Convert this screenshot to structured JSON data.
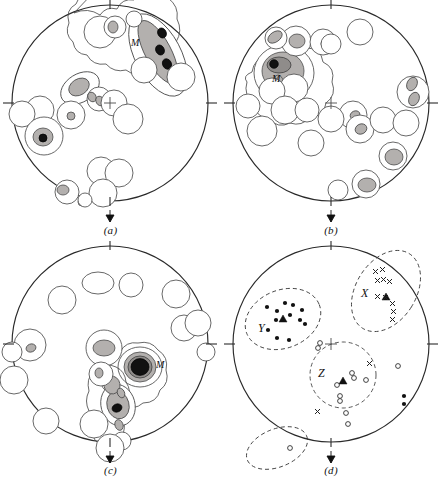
{
  "figure": {
    "kind": "stereographic-projection-fabric-diagrams",
    "panel_count": 4,
    "colors": {
      "outline": "#2a2a2a",
      "contour_line": "#4d4d4d",
      "fill_light": "#b3b0ae",
      "fill_mid": "#8f8c8a",
      "fill_max": "#111111",
      "background": "#ffffff",
      "dashed_field": "#3a3a3a"
    },
    "common": {
      "net_radius": 98,
      "tick_positions_deg": [
        0,
        90,
        180,
        270
      ],
      "center_cross_label": "center-cross",
      "arrow_label": "down-arrow-marker"
    }
  },
  "panels": [
    {
      "id": "a",
      "label": "(a)",
      "center": [
        110,
        103
      ],
      "radius": 98,
      "max_label": "M",
      "max_label_pos": [
        131,
        43
      ],
      "description": "girdle of contours with three black maxima in upper right labelled M",
      "contours": [
        {
          "level": 1,
          "class": "c1",
          "cx": 158,
          "cy": 55,
          "rx": 22,
          "ry": 44,
          "rot": -28
        },
        {
          "level": 2,
          "class": "c2",
          "cx": 158,
          "cy": 52,
          "rx": 13,
          "ry": 34,
          "rot": -28
        },
        {
          "level": 4,
          "class": "c4",
          "cx": 161,
          "cy": 33,
          "rx": 4.2,
          "ry": 5.2,
          "rot": -28
        },
        {
          "level": 4,
          "class": "c4",
          "cx": 159,
          "cy": 50,
          "rx": 4.2,
          "ry": 5.2,
          "rot": -28
        },
        {
          "level": 4,
          "class": "c4",
          "cx": 166,
          "cy": 63,
          "rx": 4.4,
          "ry": 5.4,
          "rot": -28
        },
        {
          "level": 1,
          "class": "c1",
          "cx": 80,
          "cy": 88,
          "rx": 20,
          "ry": 13,
          "rot": -32
        },
        {
          "level": 2,
          "class": "c2",
          "cx": 79,
          "cy": 87,
          "rx": 11,
          "ry": 8,
          "rot": -32
        },
        {
          "level": 1,
          "class": "c1",
          "cx": 44,
          "cy": 135,
          "rx": 19,
          "ry": 16,
          "rot": 0
        },
        {
          "level": 2,
          "class": "c2",
          "cx": 43,
          "cy": 136,
          "rx": 10,
          "ry": 9,
          "rot": 0
        },
        {
          "level": 4,
          "class": "c4",
          "cx": 43,
          "cy": 137,
          "rx": 4,
          "ry": 4,
          "rot": 0
        }
      ],
      "open_contours": [
        [
          100,
          32,
          18,
          13
        ],
        [
          64,
          118,
          16,
          16
        ],
        [
          40,
          110,
          14,
          14
        ],
        [
          128,
          120,
          14,
          14
        ],
        [
          84,
          117,
          13,
          13
        ],
        [
          101,
          171,
          14,
          12
        ],
        [
          118,
          173,
          14,
          12
        ],
        [
          103,
          193,
          14,
          13
        ],
        [
          67,
          192,
          12,
          10
        ],
        [
          144,
          68,
          13,
          13
        ],
        [
          181,
          77,
          14,
          14
        ],
        [
          109,
          99,
          13,
          12
        ]
      ]
    },
    {
      "id": "b",
      "label": "(b)",
      "center": [
        331,
        103
      ],
      "radius": 98,
      "max_label": "M",
      "max_label_pos": [
        275,
        78
      ],
      "description": "single strong maximum upper left with scattered contours to right and bottom",
      "contours": [
        {
          "level": 1,
          "class": "c1",
          "cx": 284,
          "cy": 73,
          "rx": 30,
          "ry": 27,
          "rot": 0
        },
        {
          "level": 2,
          "class": "c2",
          "cx": 283,
          "cy": 72,
          "rx": 21,
          "ry": 19,
          "rot": 0
        },
        {
          "level": 3,
          "class": "c3",
          "cx": 279,
          "cy": 66,
          "rx": 11,
          "ry": 8,
          "rot": 0
        },
        {
          "level": 4,
          "class": "c4",
          "cx": 274,
          "cy": 64,
          "rx": 4.2,
          "ry": 4.2,
          "rot": 0
        },
        {
          "level": 2,
          "class": "c2",
          "cx": 292,
          "cy": 86,
          "rx": 10,
          "ry": 11,
          "rot": 0
        },
        {
          "level": 2,
          "class": "c2",
          "cx": 278,
          "cy": 86,
          "rx": 6,
          "ry": 10,
          "rot": 0
        },
        {
          "level": 1,
          "class": "c1",
          "cx": 296,
          "cy": 41,
          "rx": 15,
          "ry": 12,
          "rot": 0
        },
        {
          "level": 2,
          "class": "c2",
          "cx": 297,
          "cy": 41,
          "rx": 8,
          "ry": 7,
          "rot": 0
        },
        {
          "level": 2,
          "class": "c2",
          "cx": 274,
          "cy": 38,
          "rx": 8,
          "ry": 6,
          "rot": -30
        },
        {
          "level": 2,
          "class": "c2",
          "cx": 394,
          "cy": 157,
          "rx": 10,
          "ry": 8,
          "rot": 0
        },
        {
          "level": 2,
          "class": "c2",
          "cx": 367,
          "cy": 185,
          "rx": 10,
          "ry": 7,
          "rot": 0
        },
        {
          "level": 2,
          "class": "c2",
          "cx": 412,
          "cy": 84,
          "rx": 5,
          "ry": 7,
          "rot": 20
        },
        {
          "level": 2,
          "class": "c2",
          "cx": 414,
          "cy": 99,
          "rx": 5,
          "ry": 7,
          "rot": 20
        },
        {
          "level": 2,
          "class": "c2",
          "cx": 355,
          "cy": 115,
          "rx": 5,
          "ry": 4,
          "rot": 0
        },
        {
          "level": 2,
          "class": "c2",
          "cx": 360,
          "cy": 129,
          "rx": 6,
          "ry": 5,
          "rot": 0
        },
        {
          "level": 2,
          "class": "c2",
          "cx": 331,
          "cy": 44,
          "rx": 5,
          "ry": 4,
          "rot": 0
        }
      ],
      "open_contours": [
        [
          317,
          42,
          14,
          13
        ],
        [
          358,
          32,
          13,
          13
        ],
        [
          285,
          109,
          14,
          14
        ],
        [
          307,
          109,
          12,
          12
        ],
        [
          262,
          132,
          15,
          14
        ],
        [
          311,
          143,
          13,
          13
        ],
        [
          340,
          118,
          13,
          13
        ],
        [
          359,
          116,
          14,
          14
        ],
        [
          385,
          119,
          13,
          13
        ],
        [
          410,
          122,
          13,
          13
        ],
        [
          414,
          92,
          15,
          16
        ],
        [
          392,
          155,
          14,
          13
        ],
        [
          366,
          184,
          14,
          12
        ],
        [
          337,
          190,
          10,
          9
        ],
        [
          300,
          74,
          15,
          15
        ]
      ]
    },
    {
      "id": "c",
      "label": "(c)",
      "center": [
        110,
        344
      ],
      "radius": 98,
      "max_label": "M",
      "max_label_pos": [
        155,
        364
      ],
      "description": "strong central black maximum labelled M with a trailing chain of contours toward lower left",
      "contours": [
        {
          "level": 1,
          "class": "c1",
          "cx": 140,
          "cy": 367,
          "rx": 22,
          "ry": 20,
          "rot": 0
        },
        {
          "level": 2,
          "class": "c2",
          "cx": 140,
          "cy": 367,
          "rx": 16,
          "ry": 15,
          "rot": 0
        },
        {
          "level": 3,
          "class": "c3",
          "cx": 140,
          "cy": 367,
          "rx": 12,
          "ry": 11,
          "rot": 0
        },
        {
          "level": 4,
          "class": "c4",
          "cx": 140,
          "cy": 367,
          "rx": 9,
          "ry": 8.4,
          "rot": 0
        },
        {
          "level": 1,
          "class": "c1",
          "cx": 104,
          "cy": 349,
          "rx": 17,
          "ry": 13,
          "rot": 0
        },
        {
          "level": 2,
          "class": "c2",
          "cx": 104,
          "cy": 348,
          "rx": 11,
          "ry": 8,
          "rot": 0
        },
        {
          "level": 1,
          "class": "c1",
          "cx": 118,
          "cy": 405,
          "rx": 17,
          "ry": 20,
          "rot": -15
        },
        {
          "level": 2,
          "class": "c2",
          "cx": 118,
          "cy": 405,
          "rx": 11,
          "ry": 14,
          "rot": -15
        },
        {
          "level": 4,
          "class": "c4",
          "cx": 117,
          "cy": 408,
          "rx": 5,
          "ry": 4,
          "rot": -20
        },
        {
          "level": 2,
          "class": "c2",
          "cx": 113,
          "cy": 385,
          "rx": 8,
          "ry": 9,
          "rot": -10
        },
        {
          "level": 2,
          "class": "c2",
          "cx": 99,
          "cy": 373,
          "rx": 4,
          "ry": 5,
          "rot": 0
        },
        {
          "level": 2,
          "class": "c2",
          "cx": 121,
          "cy": 393,
          "rx": 3.5,
          "ry": 5,
          "rot": -25
        },
        {
          "level": 2,
          "class": "c2",
          "cx": 119,
          "cy": 425,
          "rx": 4,
          "ry": 5,
          "rot": -20
        },
        {
          "level": 2,
          "class": "c2",
          "cx": 122,
          "cy": 440,
          "rx": 5,
          "ry": 6,
          "rot": -20
        },
        {
          "level": 2,
          "class": "c2",
          "cx": 31,
          "cy": 348,
          "rx": 5,
          "ry": 4,
          "rot": 0
        },
        {
          "level": 2,
          "class": "c2",
          "cx": 13,
          "cy": 352,
          "rx": 6,
          "ry": 4,
          "rot": 0
        },
        {
          "level": 2,
          "class": "c2",
          "cx": 206,
          "cy": 353,
          "rx": 6,
          "ry": 4,
          "rot": 0
        }
      ],
      "open_contours": [
        [
          62,
          300,
          14,
          13
        ],
        [
          98,
          285,
          16,
          11
        ],
        [
          176,
          295,
          14,
          13
        ],
        [
          184,
          329,
          13,
          12
        ],
        [
          196,
          324,
          13,
          12
        ],
        [
          30,
          345,
          16,
          15
        ],
        [
          16,
          378,
          13,
          15
        ],
        [
          46,
          420,
          14,
          12
        ],
        [
          94,
          425,
          14,
          14
        ],
        [
          110,
          448,
          16,
          12
        ],
        [
          101,
          375,
          12,
          12
        ],
        [
          205,
          352,
          13,
          14
        ],
        [
          131,
          287,
          13,
          10
        ]
      ]
    },
    {
      "id": "d",
      "label": "(d)",
      "center": [
        331,
        344
      ],
      "radius": 98,
      "description": "point diagram with three dashed orientation fields labelled X, Y and Z",
      "fields": [
        {
          "label": "X",
          "cx": 386,
          "cy": 291,
          "rx": 30,
          "ry": 44,
          "rot": 32,
          "label_pos": [
            365,
            292
          ]
        },
        {
          "label": "Y",
          "cx": 283,
          "cy": 319,
          "rx": 39,
          "ry": 29,
          "rot": -22,
          "label_pos": [
            262,
            327
          ]
        },
        {
          "label": "Z",
          "cx": 343,
          "cy": 375,
          "rx": 33,
          "ry": 33,
          "rot": 0,
          "label_pos": [
            322,
            372
          ]
        },
        {
          "label": "",
          "cx": 277,
          "cy": 448,
          "rx": 32,
          "ry": 19,
          "rot": -22,
          "label_pos": [
            0,
            0
          ]
        }
      ],
      "points_filled": [
        [
          267,
          307
        ],
        [
          277,
          311
        ],
        [
          285,
          303
        ],
        [
          293,
          305
        ],
        [
          302,
          310
        ],
        [
          290,
          315
        ],
        [
          276,
          320
        ],
        [
          300,
          320
        ],
        [
          305,
          323
        ],
        [
          268,
          330
        ],
        [
          277,
          338
        ],
        [
          289,
          340
        ],
        [
          404,
          396
        ],
        [
          404,
          404
        ]
      ],
      "points_open": [
        [
          318,
          348
        ],
        [
          320,
          344
        ],
        [
          352,
          373
        ],
        [
          354,
          378
        ],
        [
          366,
          380
        ],
        [
          337,
          385
        ],
        [
          340,
          396
        ],
        [
          340,
          400
        ],
        [
          346,
          413
        ],
        [
          348,
          423
        ],
        [
          398,
          366
        ],
        [
          290,
          448
        ]
      ],
      "points_triangle": [
        [
          283,
          319
        ],
        [
          386,
          297
        ],
        [
          343,
          381
        ]
      ],
      "points_x": [
        [
          376,
          272
        ],
        [
          382,
          270
        ],
        [
          378,
          281
        ],
        [
          384,
          280
        ],
        [
          388,
          281
        ],
        [
          378,
          297
        ],
        [
          385,
          298
        ],
        [
          392,
          304
        ],
        [
          393,
          312
        ],
        [
          392,
          320
        ],
        [
          370,
          364
        ],
        [
          318,
          412
        ]
      ],
      "center_cross": [
        331,
        344
      ]
    }
  ]
}
